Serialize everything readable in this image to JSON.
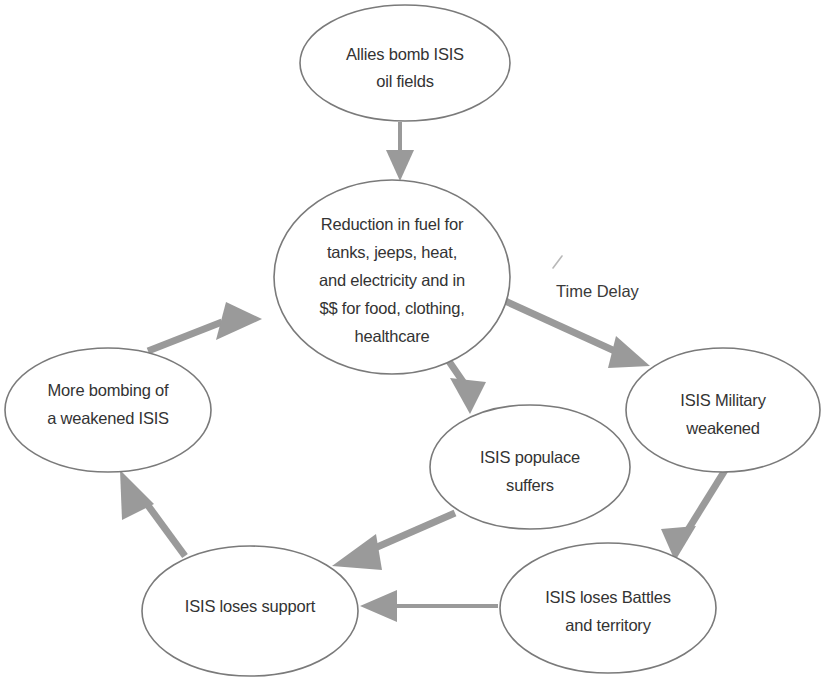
{
  "diagram": {
    "type": "causal-loop-diagram",
    "canvas": {
      "width": 827,
      "height": 681
    },
    "colors": {
      "node_stroke": "#7a7a7a",
      "node_fill": "#ffffff",
      "arrow": "#9a9a9a",
      "text": "#333333",
      "background": "#ffffff"
    },
    "nodes": [
      {
        "id": "allies-bomb",
        "lines": [
          "Allies bomb ISIS",
          "oil fields"
        ],
        "cx": 405,
        "cy": 63,
        "rx": 105,
        "ry": 58
      },
      {
        "id": "reduction-in-fuel",
        "lines": [
          "Reduction in fuel for",
          "tanks, jeeps, heat,",
          "and electricity and in",
          "$$ for food, clothing,",
          "healthcare"
        ],
        "cx": 392,
        "cy": 277,
        "rx": 118,
        "ry": 97
      },
      {
        "id": "isis-military-weakened",
        "lines": [
          "ISIS Military",
          "weakened"
        ],
        "cx": 723,
        "cy": 410,
        "rx": 97,
        "ry": 62
      },
      {
        "id": "isis-populace-suffers",
        "lines": [
          "ISIS populace",
          "suffers"
        ],
        "cx": 530,
        "cy": 467,
        "rx": 100,
        "ry": 62
      },
      {
        "id": "isis-loses-battles",
        "lines": [
          "ISIS loses Battles",
          "and territory"
        ],
        "cx": 608,
        "cy": 608,
        "rx": 108,
        "ry": 65
      },
      {
        "id": "isis-loses-support",
        "lines": [
          "ISIS loses support"
        ],
        "cx": 250,
        "cy": 611,
        "rx": 108,
        "ry": 65
      },
      {
        "id": "more-bombing",
        "lines": [
          "More bombing of",
          "a weakened ISIS"
        ],
        "cx": 108,
        "cy": 410,
        "rx": 103,
        "ry": 62
      }
    ],
    "edges": [
      {
        "id": "bomb-to-reduction",
        "from": "allies-bomb",
        "to": "reduction-in-fuel",
        "label": ""
      },
      {
        "id": "reduction-to-military",
        "from": "reduction-in-fuel",
        "to": "isis-military-weakened",
        "label": "Time Delay"
      },
      {
        "id": "reduction-to-populace",
        "from": "reduction-in-fuel",
        "to": "isis-populace-suffers",
        "label": ""
      },
      {
        "id": "military-to-battles",
        "from": "isis-military-weakened",
        "to": "isis-loses-battles",
        "label": ""
      },
      {
        "id": "battles-to-support",
        "from": "isis-loses-battles",
        "to": "isis-loses-support",
        "label": ""
      },
      {
        "id": "populace-to-support",
        "from": "isis-populace-suffers",
        "to": "isis-loses-support",
        "label": ""
      },
      {
        "id": "support-to-more-bombing",
        "from": "isis-loses-support",
        "to": "more-bombing",
        "label": ""
      },
      {
        "id": "more-bombing-to-reduction",
        "from": "more-bombing",
        "to": "reduction-in-fuel",
        "label": ""
      }
    ],
    "annotations": [
      {
        "id": "time-delay",
        "text": "Time Delay",
        "x": 556,
        "y": 293
      }
    ]
  }
}
